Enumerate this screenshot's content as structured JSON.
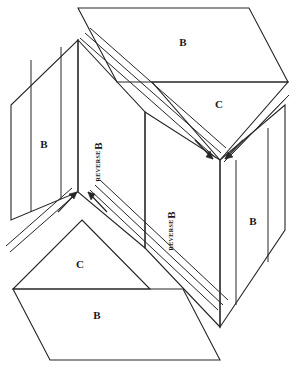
{
  "diagram": {
    "type": "isometric-folding-construction",
    "stroke_color": "#262626",
    "background_color": "#ffffff",
    "labels": {
      "top_panel_b": "B",
      "top_flap_c": "C",
      "left_panel_b": "B",
      "left_center_b": "B",
      "left_center_reverse": "REVERSE",
      "center_b": "B",
      "center_reverse": "REVERSE",
      "right_panel_b": "B",
      "bottom_flap_c": "C",
      "bottom_panel_b": "B"
    },
    "arrows": {
      "top_pair_count": "2",
      "bottom_pair_count": "2",
      "top_direction": "down-converging",
      "bottom_direction": "up-converging"
    }
  }
}
